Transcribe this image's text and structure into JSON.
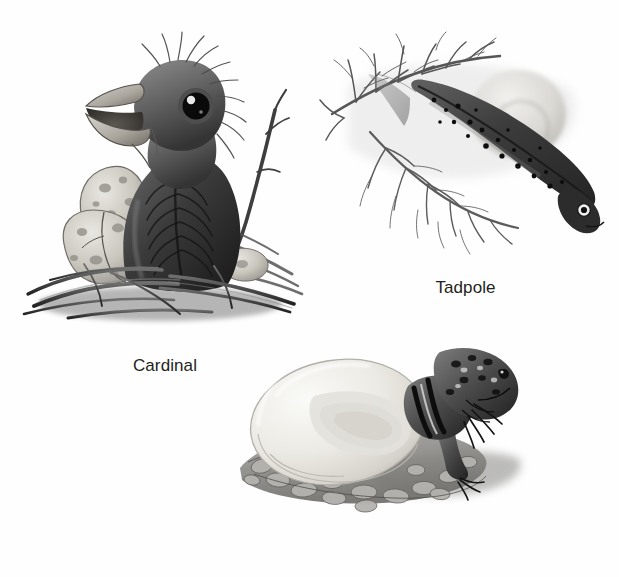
{
  "figure": {
    "background_color": "#ffffff",
    "caption_color": "#231f20",
    "style": "grayscale pencil illustration plate",
    "panels": [
      {
        "id": "cardinal",
        "caption": "Cardinal",
        "subject": "cardinal-hatchling",
        "scene_elements": [
          "nestling bird with open beak",
          "large dark eye",
          "downy wispy feathers",
          "speckled broken eggshell halves",
          "twig",
          "straw nest"
        ]
      },
      {
        "id": "tadpole",
        "caption": "Tadpole",
        "subject": "tadpole",
        "scene_elements": [
          "spotted tadpole body",
          "tail fin",
          "branching aquatic plant",
          "translucent egg jelly mass"
        ]
      },
      {
        "id": "lizard",
        "caption": "Collared Lizard",
        "subject": "collared-lizard-hatchling",
        "scene_elements": [
          "hatchling lizard emerging from egg",
          "large pale leathery egg",
          "pebble and gravel ground",
          "cast shadow"
        ]
      }
    ]
  },
  "palette": {
    "ink_dark": "#1d1d1d",
    "ink_mid": "#6b6b6b",
    "ink_light": "#b9b9b9",
    "egg_shell": "#efeeea",
    "egg_shadow": "#cfcdc6",
    "rock": "#9a9a98",
    "paper": "#ffffff"
  }
}
